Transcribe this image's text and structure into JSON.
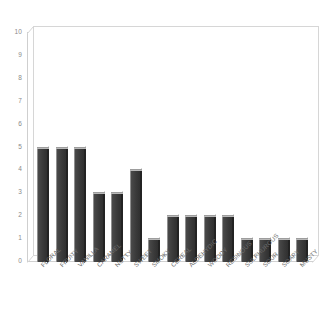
{
  "chart_data": {
    "type": "bar",
    "title": "",
    "subtitle": "",
    "xlabel": "",
    "ylabel": "",
    "ylim": [
      0,
      10
    ],
    "yticks": [
      0,
      1,
      2,
      3,
      4,
      5,
      6,
      7,
      8,
      9,
      10
    ],
    "grid": false,
    "legend": null,
    "style": "3d-bars",
    "bar_color": "#3b3b3b",
    "bar_top_color": "#b9b9b9",
    "bar_side_color": "#232323",
    "axis_color": "#d0d0d0",
    "tick_label_color": "#8a8a8a",
    "background": "#ffffff",
    "categories": [
      "FLORAL",
      "FRUITY",
      "VANILLA",
      "CARAMEL",
      "NUTTY",
      "SWEET",
      "SMOKY",
      "CEREAL",
      "ALDEHYDIC",
      "WOODY",
      "RESINOUS",
      "SULPHUROUS",
      "SOUR",
      "SOAPY",
      "MUSTY"
    ],
    "values": [
      5,
      5,
      5,
      3,
      3,
      4,
      1,
      2,
      2,
      2,
      2,
      1,
      1,
      1,
      1
    ]
  }
}
